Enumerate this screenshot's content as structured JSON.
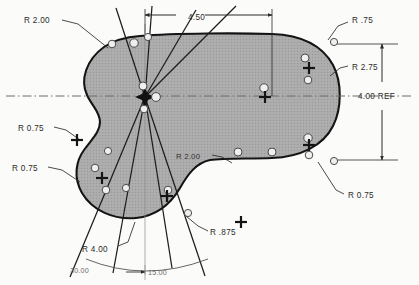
{
  "drawing": {
    "title": "Mechanical part outline with radius dimensions",
    "background_color": "#ffffff",
    "part_fill_color": "#a8a8a8",
    "part_outline_color": "#1a1a1a",
    "line_color": "#2b2b2b",
    "centerline_color": "#555555"
  },
  "dimensions": [
    {
      "id": "r200-upper-left",
      "label": "R 2.00",
      "x": 24,
      "y": 20
    },
    {
      "id": "len-450",
      "label": "4.50",
      "x": 188,
      "y": 20
    },
    {
      "id": "r75-upper-right",
      "label": "R .75",
      "x": 352,
      "y": 20
    },
    {
      "id": "r275-right",
      "label": "R 2.75",
      "x": 352,
      "y": 67
    },
    {
      "id": "ref-400",
      "label": "4.00 REF",
      "x": 382,
      "y": 93
    },
    {
      "id": "r075-left-upper",
      "label": "R 0.75",
      "x": 18,
      "y": 128
    },
    {
      "id": "r075-left-lower",
      "label": "R 0.75",
      "x": 12,
      "y": 168
    },
    {
      "id": "r200-inner",
      "label": "R 2.00",
      "x": 176,
      "y": 156
    },
    {
      "id": "r075-lower-right",
      "label": "R 0.75",
      "x": 348,
      "y": 195
    },
    {
      "id": "r875-bottom",
      "label": "R .875",
      "x": 210,
      "y": 232
    },
    {
      "id": "r400-bottom",
      "label": "R 4.00",
      "x": 82,
      "y": 249
    },
    {
      "id": "ang-3000",
      "label": "30.00",
      "x": 70,
      "y": 270
    },
    {
      "id": "ang-1500",
      "label": "15.00",
      "x": 148,
      "y": 272
    }
  ],
  "markers": {
    "center_point_label": "construction-center",
    "cross_markers": 6,
    "hole_markers": 14
  }
}
